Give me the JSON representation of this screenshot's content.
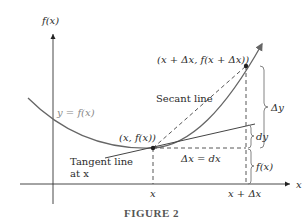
{
  "figure": {
    "caption": "FIGURE 2",
    "axes": {
      "y_label": "f(x)",
      "x_label": "x",
      "x_ticks": [
        "x",
        "x + Δx"
      ]
    },
    "labels": {
      "curve": "y = f(x)",
      "secant": "Secant line",
      "tangent_line1": "Tangent line",
      "tangent_line2": "at x",
      "point1": "(x, f(x))",
      "point2": "(x + Δx, f(x + Δx))",
      "delta_x": "Δx = dx",
      "delta_y": "Δy",
      "dy": "dy",
      "fx": "f(x)"
    },
    "colors": {
      "curve": "#666666",
      "axis": "#333333",
      "text": "#2b2b2b"
    }
  }
}
